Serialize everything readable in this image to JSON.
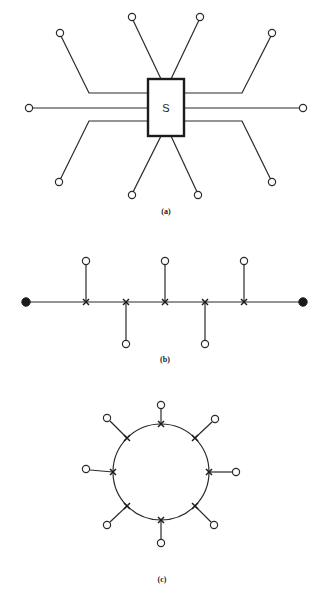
{
  "figure": {
    "panels": [
      {
        "id": "a",
        "caption": "(a)",
        "topology": "star",
        "center": {
          "label": "S",
          "shape": "rectangle"
        },
        "node_count": 10
      },
      {
        "id": "b",
        "caption": "(b)",
        "topology": "bus",
        "terminators": 2,
        "tap_count": 5,
        "node_count": 5
      },
      {
        "id": "c",
        "caption": "(c)",
        "topology": "ring",
        "tap_count": 8,
        "node_count": 8
      }
    ]
  },
  "colors": {
    "stroke": "#2a2a2a",
    "fill": "#ffffff",
    "terminator": "#1a1a1a"
  }
}
